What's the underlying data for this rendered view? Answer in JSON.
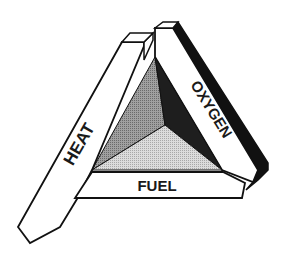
{
  "diagram": {
    "sides": [
      {
        "id": "heat",
        "label": "HEAT"
      },
      {
        "id": "oxygen",
        "label": "OXYGEN"
      },
      {
        "id": "fuel",
        "label": "FUEL"
      }
    ],
    "colors": {
      "outline": "#111111",
      "bar_face": "#ffffff",
      "bar_shadow": "#111111",
      "pyramid_left": "#8c8c8c",
      "pyramid_right": "#1e1e1e",
      "pyramid_bottom": "#c9c9c9"
    }
  }
}
